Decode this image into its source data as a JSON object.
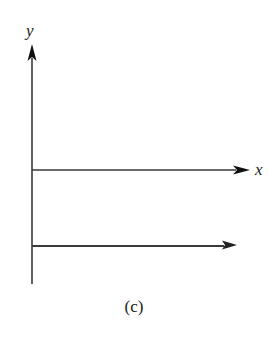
{
  "figure": {
    "caption": "(c)",
    "colors": {
      "line": "#3a3a3a",
      "arrowhead": "#111111",
      "text": "#222222",
      "background": "#ffffff"
    },
    "y_axis": {
      "label": "y",
      "x": 32,
      "top": 44,
      "bottom": 284
    },
    "x_axis": {
      "label": "x",
      "y": 170,
      "start": 32,
      "end": 250
    },
    "vector": {
      "y": 246,
      "start": 32,
      "end": 236
    }
  }
}
